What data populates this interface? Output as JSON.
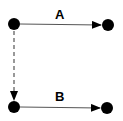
{
  "diagram": {
    "nodes": [
      {
        "id": "n1",
        "cx": 14,
        "cy": 24,
        "r": 6
      },
      {
        "id": "n2",
        "cx": 108,
        "cy": 25,
        "r": 6
      },
      {
        "id": "n3",
        "cx": 14,
        "cy": 107,
        "r": 6
      },
      {
        "id": "n4",
        "cx": 107,
        "cy": 108,
        "r": 6
      }
    ],
    "edges": [
      {
        "id": "edge-a",
        "label": "A",
        "from": "n1",
        "to": "n2",
        "style": "solid"
      },
      {
        "id": "edge-b",
        "label": "B",
        "from": "n3",
        "to": "n4",
        "style": "solid"
      },
      {
        "id": "edge-dashed",
        "label": "",
        "from": "n1",
        "to": "n3",
        "style": "dashed"
      }
    ],
    "labels": {
      "a": "A",
      "b": "B"
    },
    "colors": {
      "node": "#000000",
      "line": "#555555"
    }
  }
}
